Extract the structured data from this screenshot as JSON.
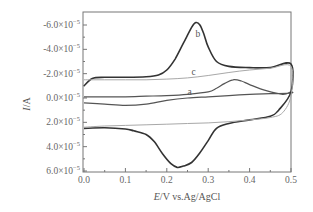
{
  "chart_data": {
    "type": "line",
    "title": "",
    "xlabel_italic": "E",
    "xlabel_rest": "/V vs.Ag/AgCl",
    "ylabel_italic": "I",
    "ylabel_rest": "/A",
    "xlim": [
      0.0,
      0.5
    ],
    "ylim": [
      6e-05,
      -7e-05
    ],
    "y_axis_inverted": true,
    "grid": false,
    "x_ticks": [
      "0.0",
      "0.1",
      "0.2",
      "0.3",
      "0.4",
      "0.5"
    ],
    "y_ticks": [
      {
        "mantissa": "-6.0",
        "value": -6e-05
      },
      {
        "mantissa": "-4.0",
        "value": -4e-05
      },
      {
        "mantissa": "-2.0",
        "value": -2e-05
      },
      {
        "mantissa": "0.0",
        "value": 0.0
      },
      {
        "mantissa": "2.0",
        "value": 2e-05
      },
      {
        "mantissa": "4.0",
        "value": 4e-05
      },
      {
        "mantissa": "6.0",
        "value": 6e-05
      }
    ],
    "y_tick_suffix": "×10",
    "y_tick_exponent": "−5",
    "series": [
      {
        "name": "a",
        "color": "#555555",
        "width": 1.2,
        "forward": {
          "x": [
            0.0,
            0.05,
            0.1,
            0.15,
            0.2,
            0.25,
            0.3,
            0.32,
            0.34,
            0.36,
            0.38,
            0.4,
            0.44,
            0.48,
            0.5
          ],
          "y": [
            -1e-06,
            -1e-06,
            -1e-06,
            -1.5e-06,
            -2e-06,
            -3e-06,
            -5e-06,
            -8e-06,
            -1.2e-05,
            -1.5e-05,
            -1.4e-05,
            -1.1e-05,
            -6e-06,
            -3e-06,
            -5e-06
          ]
        },
        "reverse": {
          "x": [
            0.5,
            0.45,
            0.4,
            0.35,
            0.3,
            0.25,
            0.2,
            0.15,
            0.1,
            0.05,
            0.0
          ],
          "y": [
            -4e-06,
            -3.5e-06,
            -3e-06,
            -2e-06,
            -1e-06,
            0.0,
            2e-06,
            5e-06,
            6e-06,
            5e-06,
            4e-06
          ]
        }
      },
      {
        "name": "b",
        "color": "#333333",
        "width": 1.6,
        "forward": {
          "x": [
            0.0,
            0.02,
            0.05,
            0.1,
            0.15,
            0.18,
            0.2,
            0.22,
            0.24,
            0.26,
            0.27,
            0.28,
            0.29,
            0.3,
            0.32,
            0.35,
            0.4,
            0.45,
            0.5
          ],
          "y": [
            -1e-05,
            -1.6e-05,
            -1.7e-05,
            -1.7e-05,
            -1.75e-05,
            -1.9e-05,
            -2.3e-05,
            -3.2e-05,
            -4.5e-05,
            -5.8e-05,
            -6.2e-05,
            -6e-05,
            -5.2e-05,
            -4.2e-05,
            -3e-05,
            -2.6e-05,
            -2.5e-05,
            -2.5e-05,
            -2.8e-05
          ]
        },
        "reverse": {
          "x": [
            0.5,
            0.47,
            0.45,
            0.4,
            0.35,
            0.32,
            0.3,
            0.28,
            0.26,
            0.24,
            0.225,
            0.21,
            0.19,
            0.17,
            0.15,
            0.12,
            0.1,
            0.05,
            0.0
          ],
          "y": [
            -5e-06,
            1e-05,
            1.5e-05,
            1.8e-05,
            2.1e-05,
            2.5e-05,
            3.5e-05,
            4.5e-05,
            5.3e-05,
            5.6e-05,
            5.7e-05,
            5.4e-05,
            4.6e-05,
            3.6e-05,
            3e-05,
            2.7e-05,
            2.55e-05,
            2.45e-05,
            2.5e-05
          ]
        }
      },
      {
        "name": "c",
        "color": "#a8a8a8",
        "width": 1.0,
        "forward": {
          "x": [
            0.0,
            0.05,
            0.1,
            0.15,
            0.2,
            0.25,
            0.3,
            0.35,
            0.4,
            0.45,
            0.5
          ],
          "y": [
            -1.5e-05,
            -1.5e-05,
            -1.5e-05,
            -1.5e-05,
            -1.55e-05,
            -1.65e-05,
            -1.85e-05,
            -2.1e-05,
            -2.3e-05,
            -2.45e-05,
            -2.6e-05
          ]
        },
        "reverse": {
          "x": [
            0.5,
            0.48,
            0.45,
            0.4,
            0.35,
            0.3,
            0.25,
            0.2,
            0.15,
            0.1,
            0.05,
            0.0
          ],
          "y": [
            -2e-06,
            1.2e-05,
            1.6e-05,
            1.8e-05,
            1.95e-05,
            2.05e-05,
            2.1e-05,
            2.15e-05,
            2.2e-05,
            2.25e-05,
            2.3e-05,
            2.4e-05
          ]
        }
      }
    ],
    "annotations": [
      {
        "text": "b",
        "x": 0.275,
        "y": -5.3e-05
      },
      {
        "text": "c",
        "x": 0.265,
        "y": -2.15e-05
      },
      {
        "text": "a",
        "x": 0.255,
        "y": -5e-06
      }
    ],
    "legend": null
  }
}
